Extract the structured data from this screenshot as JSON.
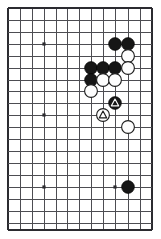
{
  "figure": {
    "kind": "go-board-diagram",
    "background_color": "#ffffff"
  },
  "board": {
    "line_color": "#4d4d52",
    "edge_color": "#2b2b30",
    "star_point_color": "#2b2b30",
    "columns": 13,
    "rows": 19,
    "column_x": [
      8,
      20,
      32,
      44,
      56,
      67,
      79,
      91,
      103,
      115,
      128,
      140,
      152
    ],
    "row_y": [
      8,
      20,
      32,
      44,
      56,
      68,
      80,
      91,
      103,
      115,
      127,
      139,
      151,
      163,
      175,
      187,
      199,
      211,
      223
    ],
    "edges": {
      "left": 8,
      "right": 152,
      "top": 8,
      "bottom": 230
    },
    "star_points": [
      {
        "col": 3,
        "row": 3
      },
      {
        "col": 3,
        "row": 9
      },
      {
        "col": 3,
        "row": 15
      },
      {
        "col": 9,
        "row": 15
      }
    ],
    "stone_radius": 6.4
  },
  "stones": [
    {
      "id": "b1",
      "color": "black",
      "col": 9,
      "row": 3,
      "marker": "none"
    },
    {
      "id": "b2",
      "color": "black",
      "col": 10,
      "row": 3,
      "marker": "none"
    },
    {
      "id": "w1",
      "color": "white",
      "col": 10,
      "row": 4,
      "marker": "none"
    },
    {
      "id": "b3",
      "color": "black",
      "col": 7,
      "row": 5,
      "marker": "none"
    },
    {
      "id": "b4",
      "color": "black",
      "col": 8,
      "row": 5,
      "marker": "none"
    },
    {
      "id": "b5",
      "color": "black",
      "col": 9,
      "row": 5,
      "marker": "none"
    },
    {
      "id": "w2",
      "color": "white",
      "col": 10,
      "row": 5,
      "marker": "none"
    },
    {
      "id": "b6",
      "color": "black",
      "col": 7,
      "row": 6,
      "marker": "none"
    },
    {
      "id": "w3",
      "color": "white",
      "col": 8,
      "row": 6,
      "marker": "none"
    },
    {
      "id": "w4",
      "color": "white",
      "col": 9,
      "row": 6,
      "marker": "none"
    },
    {
      "id": "w5",
      "color": "white",
      "col": 7,
      "row": 7,
      "marker": "none"
    },
    {
      "id": "b7",
      "color": "black",
      "col": 9,
      "row": 8,
      "marker": "triangle"
    },
    {
      "id": "w6",
      "color": "white",
      "col": 8,
      "row": 9,
      "marker": "triangle"
    },
    {
      "id": "w7",
      "color": "white",
      "col": 10,
      "row": 10,
      "marker": "none"
    },
    {
      "id": "b8",
      "color": "black",
      "col": 10,
      "row": 15,
      "marker": "none"
    }
  ],
  "colors": {
    "black_stone": "#161616",
    "white_stone": "#fdfdfd",
    "white_stone_outline": "#1c1c1c",
    "black_marker": "#fafafa",
    "white_marker": "#1c1c1c"
  }
}
